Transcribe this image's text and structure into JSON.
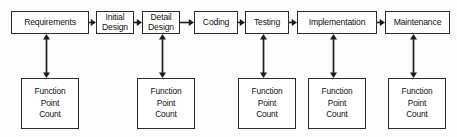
{
  "diagram": {
    "type": "process-flow",
    "background_color": "#fdfdfd",
    "line_color": "#1d1d1d",
    "box_fill": "#ffffff",
    "stages": [
      {
        "id": "requirements",
        "label": "Requirements",
        "x": 11,
        "y": 11,
        "w": 78,
        "two_line": false
      },
      {
        "id": "initial-design",
        "label": "Initial\nDesign",
        "x": 96,
        "y": 11,
        "w": 38,
        "two_line": true
      },
      {
        "id": "detail-design",
        "label": "Detail\nDesign",
        "x": 142,
        "y": 11,
        "w": 38,
        "two_line": true
      },
      {
        "id": "coding",
        "label": "Coding",
        "x": 194,
        "y": 11,
        "w": 44,
        "two_line": false
      },
      {
        "id": "testing",
        "label": "Testing",
        "x": 245,
        "y": 11,
        "w": 44,
        "two_line": false
      },
      {
        "id": "implementation",
        "label": "Implementation",
        "x": 297,
        "y": 11,
        "w": 80,
        "two_line": false
      },
      {
        "id": "maintenance",
        "label": "Maintenance",
        "x": 385,
        "y": 11,
        "w": 65,
        "two_line": false
      }
    ],
    "flow_arrows": [
      {
        "id": "requirements-to-initial-design",
        "x": 89,
        "y": 18,
        "w": 7
      },
      {
        "id": "initial-design-to-detail-design",
        "x": 134,
        "y": 18,
        "w": 8
      },
      {
        "id": "detail-design-to-coding",
        "x": 180,
        "y": 18,
        "w": 14
      },
      {
        "id": "coding-to-testing",
        "x": 238,
        "y": 18,
        "w": 7
      },
      {
        "id": "testing-to-implementation",
        "x": 289,
        "y": 18,
        "w": 8
      },
      {
        "id": "implementation-to-maintenance",
        "x": 377,
        "y": 18,
        "w": 8
      }
    ],
    "counts": [
      {
        "id": "fpc-requirements",
        "label": "Function\nPoint\nCount",
        "x": 21,
        "y": 78,
        "w": 58,
        "arrow_x": 46,
        "arrow_y": 34
      },
      {
        "id": "fpc-detail-design",
        "label": "Function\nPoint\nCount",
        "x": 137,
        "y": 78,
        "w": 58,
        "arrow_x": 162,
        "arrow_y": 34
      },
      {
        "id": "fpc-testing",
        "label": "Function\nPoint\nCount",
        "x": 238,
        "y": 78,
        "w": 58,
        "arrow_x": 263,
        "arrow_y": 34
      },
      {
        "id": "fpc-implementation",
        "label": "Function\nPoint\nCount",
        "x": 308,
        "y": 78,
        "w": 58,
        "arrow_x": 333,
        "arrow_y": 34
      },
      {
        "id": "fpc-maintenance",
        "label": "Function\nPoint\nCount",
        "x": 388,
        "y": 78,
        "w": 58,
        "arrow_x": 413,
        "arrow_y": 34
      }
    ],
    "measure_arrow": {
      "height": 44,
      "double_headed": true
    }
  }
}
